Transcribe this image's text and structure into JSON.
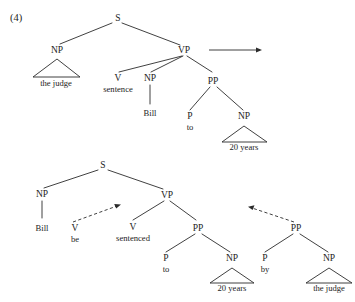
{
  "figure": {
    "example_number": "(4)",
    "transformation_arrow": "solid-rightward-arrow",
    "accent_color": "#2b2b2b",
    "text_color": "#1d1d1d",
    "background_color": "#ffffff"
  },
  "tree_active": {
    "caption": "active clause structure",
    "nodes": {
      "s": "S",
      "np_subject": "NP",
      "vp": "VP",
      "v": "V",
      "np_object": "NP",
      "pp": "PP",
      "p": "P",
      "np_pp_object": "NP"
    },
    "leaves": {
      "subject": "the judge",
      "verb": "sentence",
      "object": "Bill",
      "preposition": "to",
      "pp_object": "20 years"
    }
  },
  "tree_passive": {
    "caption": "passive clause structure",
    "nodes": {
      "s": "S",
      "np_subject": "NP",
      "v_aux": "V",
      "vp": "VP",
      "v_main": "V",
      "pp_to": "PP",
      "p_to": "P",
      "np_to_object": "NP",
      "pp_by": "PP",
      "p_by": "P",
      "np_by_object": "NP"
    },
    "leaves": {
      "subject": "Bill",
      "aux": "be",
      "verb": "sentenced",
      "preposition_to": "to",
      "to_object": "20 years",
      "preposition_by": "by",
      "by_object": "the judge"
    },
    "movement_arrows": [
      "aux-raising-dashed-arrow",
      "by-phrase-dashed-arrow"
    ]
  }
}
